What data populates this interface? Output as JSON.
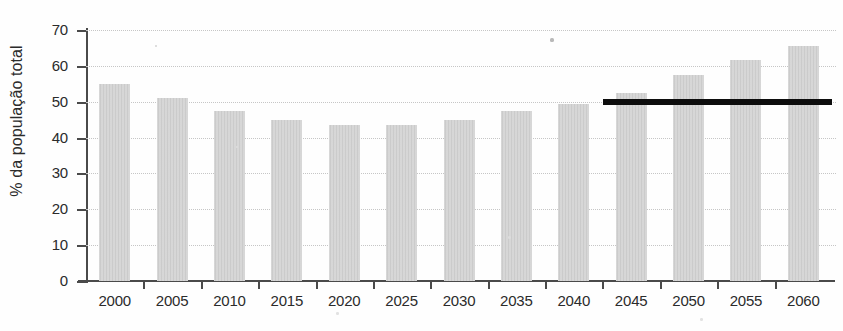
{
  "chart_data": {
    "type": "bar",
    "title": "",
    "subtitle": "",
    "xlabel": "",
    "ylabel": "% da população total",
    "ylim": [
      0,
      70
    ],
    "ytick_step": 10,
    "yticks": [
      0,
      10,
      20,
      30,
      40,
      50,
      60,
      70
    ],
    "grid": true,
    "grid_style": "dotted-horizontal",
    "legend": "none",
    "categories": [
      "2000",
      "2005",
      "2010",
      "2015",
      "2020",
      "2025",
      "2030",
      "2035",
      "2040",
      "2045",
      "2050",
      "2055",
      "2060"
    ],
    "values": [
      55,
      51,
      47.5,
      45,
      43.5,
      43.5,
      45,
      47.5,
      49.5,
      52.5,
      57.5,
      61.5,
      65.5
    ],
    "bar_color": "#cbcbcb",
    "annotations": [
      {
        "name": "reference-line-50",
        "type": "horizontal-line",
        "value": 50,
        "x_start_category": "2045",
        "x_end_category": "2060",
        "color": "#0d0d0d",
        "label": ""
      }
    ]
  },
  "axis": {
    "color": "#4a4a4a",
    "y_title": "% da população total"
  }
}
